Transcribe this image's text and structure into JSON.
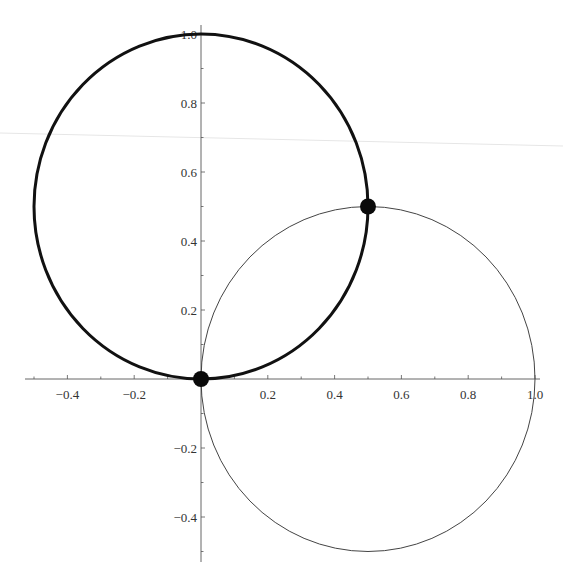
{
  "chart_data": {
    "type": "line",
    "title": "",
    "xlabel": "",
    "ylabel": "",
    "xlim": [
      -0.52,
      1.02
    ],
    "ylim": [
      -0.52,
      1.02
    ],
    "grid": false,
    "legend": null,
    "x_ticks": [
      "-0.4",
      "-0.2",
      "0.2",
      "0.4",
      "0.6",
      "0.8",
      "1.0"
    ],
    "y_ticks": [
      "-0.4",
      "-0.2",
      "0.2",
      "0.4",
      "0.6",
      "0.8",
      "1.0"
    ],
    "series": [
      {
        "name": "thick-circle",
        "shape": "circle",
        "center": [
          0,
          0.5
        ],
        "radius": 0.5,
        "stroke": "#111111",
        "stroke_width": 3
      },
      {
        "name": "thin-circle",
        "shape": "circle",
        "center": [
          0.5,
          0
        ],
        "radius": 0.5,
        "stroke": "#444444",
        "stroke_width": 1
      }
    ],
    "points": [
      {
        "x": 0,
        "y": 0,
        "label": "intersection-origin"
      },
      {
        "x": 0.5,
        "y": 0.5,
        "label": "intersection-upper"
      }
    ]
  },
  "axes": {
    "x_labels": [
      {
        "value": -0.4,
        "text": "−0.4"
      },
      {
        "value": -0.2,
        "text": "−0.2"
      },
      {
        "value": 0.2,
        "text": "0.2"
      },
      {
        "value": 0.4,
        "text": "0.4"
      },
      {
        "value": 0.6,
        "text": "0.6"
      },
      {
        "value": 0.8,
        "text": "0.8"
      },
      {
        "value": 1.0,
        "text": "1.0"
      }
    ],
    "y_labels": [
      {
        "value": 1.0,
        "text": "1.0"
      },
      {
        "value": 0.8,
        "text": "0.8"
      },
      {
        "value": 0.6,
        "text": "0.6"
      },
      {
        "value": 0.4,
        "text": "0.4"
      },
      {
        "value": 0.2,
        "text": "0.2"
      },
      {
        "value": -0.2,
        "text": "−0.2"
      },
      {
        "value": -0.4,
        "text": "−0.4"
      }
    ]
  },
  "colors": {
    "axis": "#555555",
    "thick_curve": "#111111",
    "thin_curve": "#444444",
    "point": "#0a0a0a"
  }
}
